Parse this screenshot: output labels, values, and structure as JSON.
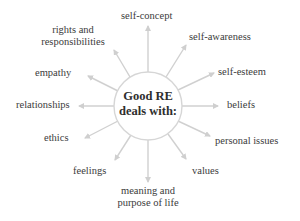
{
  "diagram": {
    "center": {
      "line1": "Good RE",
      "line2": "deals with:"
    },
    "colors": {
      "arrow": "#cfcfcf",
      "circle": "#d4d4d4",
      "text": "#3b3b3b"
    },
    "nodes": [
      {
        "id": "self-concept",
        "label": "self-concept"
      },
      {
        "id": "self-awareness",
        "label": "self-awareness"
      },
      {
        "id": "self-esteem",
        "label": "self-esteem"
      },
      {
        "id": "beliefs",
        "label": "beliefs"
      },
      {
        "id": "personal-issues",
        "label": "personal issues"
      },
      {
        "id": "values",
        "label": "values"
      },
      {
        "id": "meaning",
        "line1": "meaning and",
        "line2": "purpose of life"
      },
      {
        "id": "feelings",
        "label": "feelings"
      },
      {
        "id": "ethics",
        "label": "ethics"
      },
      {
        "id": "relationships",
        "label": "relationships"
      },
      {
        "id": "empathy",
        "label": "empathy"
      },
      {
        "id": "rights",
        "line1": "rights and",
        "line2": "responsibilities"
      }
    ]
  }
}
